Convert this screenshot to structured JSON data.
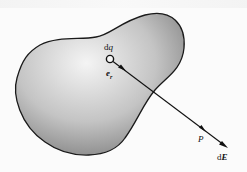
{
  "diagram": {
    "labels": {
      "charge_element": "dq",
      "unit_vector_e": "e",
      "unit_vector_sub": "r",
      "point": "P",
      "field_d": "d",
      "field_E": "E"
    },
    "colors": {
      "outline": "#1a1a1a",
      "fill_light": "#f2f2f2",
      "fill_dark": "#8a8a8a",
      "arrow": "#111111"
    }
  }
}
